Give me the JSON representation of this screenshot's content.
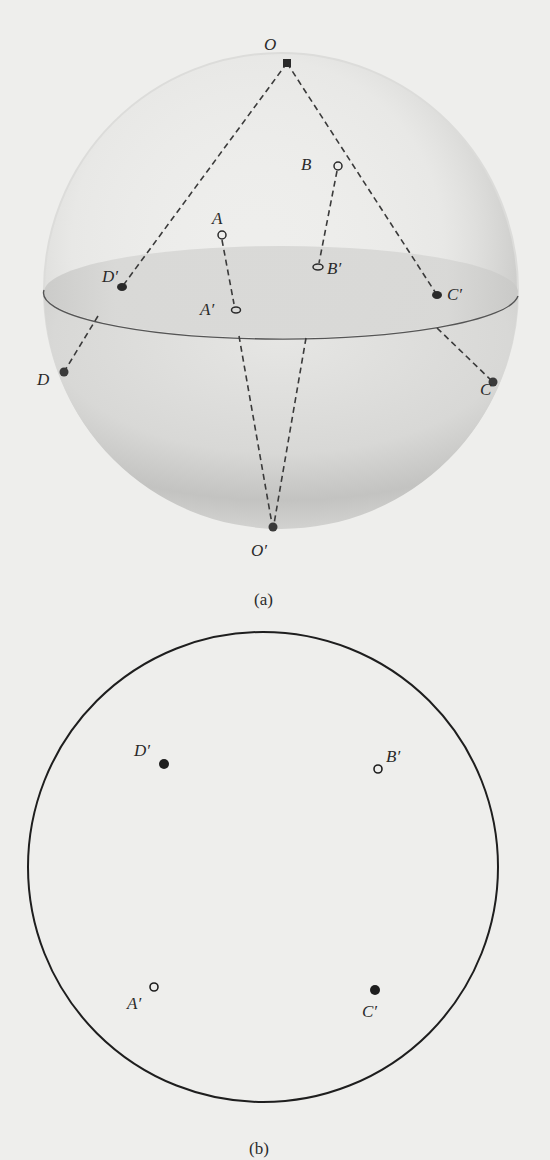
{
  "figure_a": {
    "caption": "(a)",
    "points": {
      "O": "O",
      "O_prime": "O′",
      "A": "A",
      "A_prime": "A′",
      "B": "B",
      "B_prime": "B′",
      "C": "C",
      "C_prime": "C′",
      "D": "D",
      "D_prime": "D′"
    }
  },
  "figure_b": {
    "caption": "(b)",
    "points": {
      "A_prime": "A′",
      "B_prime": "B′",
      "C_prime": "C′",
      "D_prime": "D′"
    }
  },
  "colors": {
    "background": "#eeeeec",
    "ink": "#2a2a2a",
    "sphere_shade": "#c9c9c7",
    "plane_fill": "#d6d6d4"
  }
}
